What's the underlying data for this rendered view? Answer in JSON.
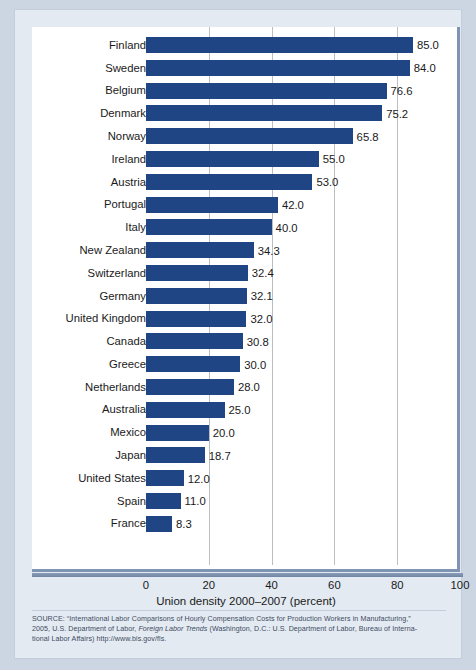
{
  "chart_data": {
    "type": "bar",
    "orientation": "horizontal",
    "title": "",
    "xlabel": "Union density 2000–2007 (percent)",
    "ylabel": "",
    "xlim": [
      0,
      100
    ],
    "xticks": [
      0,
      20,
      40,
      60,
      80,
      100
    ],
    "grid": "vertical gridlines at 20, 40, 60, 80",
    "legend": "none",
    "bar_color": "#1f4584",
    "categories": [
      "Finland",
      "Sweden",
      "Belgium",
      "Denmark",
      "Norway",
      "Ireland",
      "Austria",
      "Portugal",
      "Italy",
      "New Zealand",
      "Switzerland",
      "Germany",
      "United Kingdom",
      "Canada",
      "Greece",
      "Netherlands",
      "Australia",
      "Mexico",
      "Japan",
      "United States",
      "Spain",
      "France"
    ],
    "values": [
      85.0,
      84.0,
      76.6,
      75.2,
      65.8,
      55.0,
      53.0,
      42.0,
      40.0,
      34.3,
      32.4,
      32.1,
      32.0,
      30.8,
      30.0,
      28.0,
      25.0,
      20.0,
      18.7,
      12.0,
      11.0,
      8.3
    ],
    "value_labels": [
      "85.0",
      "84.0",
      "76.6",
      "75.2",
      "65.8",
      "55.0",
      "53.0",
      "42.0",
      "40.0",
      "34.3",
      "32.4",
      "32.1",
      "32.0",
      "30.8",
      "30.0",
      "28.0",
      "25.0",
      "20.0",
      "18.7",
      "12.0",
      "11.0",
      "8.3"
    ]
  },
  "axis": {
    "tick_labels": [
      "0",
      "20",
      "40",
      "60",
      "80",
      "100"
    ],
    "title": "Union density 2000–2007 (percent)"
  },
  "source": {
    "line1": "SOURCE: “International Labor Comparisons of Hourly Compensation Costs for Production Workers in Manufacturing,”",
    "line2_a": "2005, U.S. Department of Labor, ",
    "line2_italic": "Foreign Labor Trends",
    "line2_b": "  (Washington, D.C.: U.S. Department of Labor, Bureau of Interna-",
    "line3": "tional Labor Affairs) http://www.bls.gov/fls."
  }
}
